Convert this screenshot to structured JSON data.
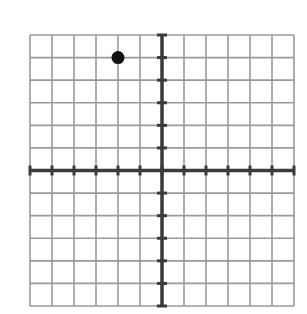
{
  "chart_data": {
    "type": "scatter",
    "title": "",
    "xlabel": "",
    "ylabel": "",
    "xlim": [
      -6,
      6
    ],
    "ylim": [
      -6,
      6
    ],
    "grid": true,
    "tick_step": 1,
    "tick_labels": false,
    "legend": null,
    "points": [
      {
        "x": -2,
        "y": 5
      }
    ]
  },
  "colors": {
    "grid": "#9a9a9a",
    "axis": "#3a3a3a",
    "point": "#111111",
    "background": "#ffffff"
  }
}
